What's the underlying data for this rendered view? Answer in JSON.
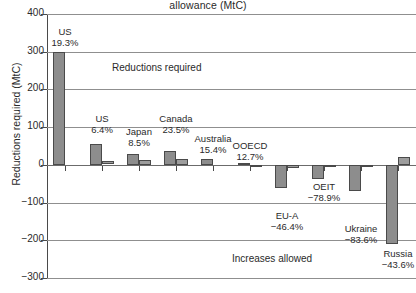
{
  "chart_data": {
    "type": "bar",
    "title": "allowance (MtC)",
    "xlabel": "",
    "ylabel": "Reductions required (MtC)",
    "ylim": [
      -300,
      400
    ],
    "yticks": [
      400,
      300,
      200,
      100,
      0,
      -100,
      -200,
      -300
    ],
    "ytick_labels": [
      "400",
      "300",
      "200",
      "100",
      "0",
      "−100",
      "−200",
      "−300"
    ],
    "grid": true,
    "legend": "none",
    "categories": [
      "US",
      "US",
      "Japan",
      "Canada",
      "Australia",
      "OOECD",
      "EU-A",
      "OEIT",
      "Ukraine",
      "Russia"
    ],
    "percent_labels": [
      "19.3%",
      "6.4%",
      "8.5%",
      "23.5%",
      "15.4%",
      "12.7%",
      "−46.4%",
      "−78.9%",
      "−83.6%",
      "−43.6%"
    ],
    "series": [
      {
        "name": "Series A",
        "color": "#8d8d8d",
        "values": [
          300,
          55,
          30,
          38,
          16,
          5,
          -62,
          -38,
          -70,
          -210
        ]
      },
      {
        "name": "Series B",
        "color": "#9d9d9d",
        "values": [
          0,
          9,
          14,
          16,
          0,
          -3,
          -7,
          -5,
          -4,
          22
        ]
      }
    ],
    "annotations": [
      {
        "text": "Reductions required",
        "x_px": 112,
        "y_px": 62
      },
      {
        "text": "Increases allowed",
        "x_px": 232,
        "y_px": 253
      }
    ]
  },
  "axis": {
    "y_title": "Reductions required (MtC)"
  }
}
